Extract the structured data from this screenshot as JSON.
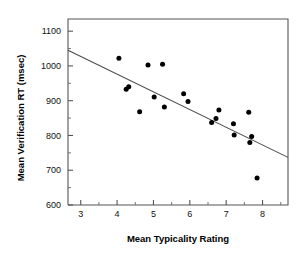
{
  "chart_data": {
    "type": "scatter",
    "title": "",
    "xlabel": "Mean Typicality Rating",
    "ylabel": "Mean Verification RT (msec)",
    "xlim": [
      2.65,
      8.7
    ],
    "ylim": [
      600,
      1135
    ],
    "xticks": [
      3,
      4,
      5,
      6,
      7,
      8
    ],
    "yticks": [
      600,
      700,
      800,
      900,
      1000,
      1100
    ],
    "xtick_labels": [
      "3",
      "4",
      "5",
      "6",
      "7",
      "8"
    ],
    "ytick_labels": [
      "600",
      "700",
      "800",
      "900",
      "1000",
      "1100"
    ],
    "minor_ticks": true,
    "grid": false,
    "legend": "none",
    "point_color": "#000000",
    "line_color": "#4a4a4a",
    "axis_color": "#555555",
    "points": [
      {
        "x": 4.05,
        "y": 1022
      },
      {
        "x": 4.25,
        "y": 933
      },
      {
        "x": 4.32,
        "y": 940
      },
      {
        "x": 4.62,
        "y": 868
      },
      {
        "x": 4.85,
        "y": 1003
      },
      {
        "x": 5.02,
        "y": 911
      },
      {
        "x": 5.25,
        "y": 1005
      },
      {
        "x": 5.3,
        "y": 882
      },
      {
        "x": 5.83,
        "y": 920
      },
      {
        "x": 5.95,
        "y": 898
      },
      {
        "x": 6.6,
        "y": 837
      },
      {
        "x": 6.72,
        "y": 849
      },
      {
        "x": 6.8,
        "y": 873
      },
      {
        "x": 7.2,
        "y": 834
      },
      {
        "x": 7.22,
        "y": 801
      },
      {
        "x": 7.62,
        "y": 867
      },
      {
        "x": 7.65,
        "y": 780
      },
      {
        "x": 7.7,
        "y": 797
      },
      {
        "x": 7.85,
        "y": 678
      }
    ],
    "trendline": {
      "x_start": 2.65,
      "y_start": 1045,
      "x_end": 8.7,
      "y_end": 737
    }
  }
}
